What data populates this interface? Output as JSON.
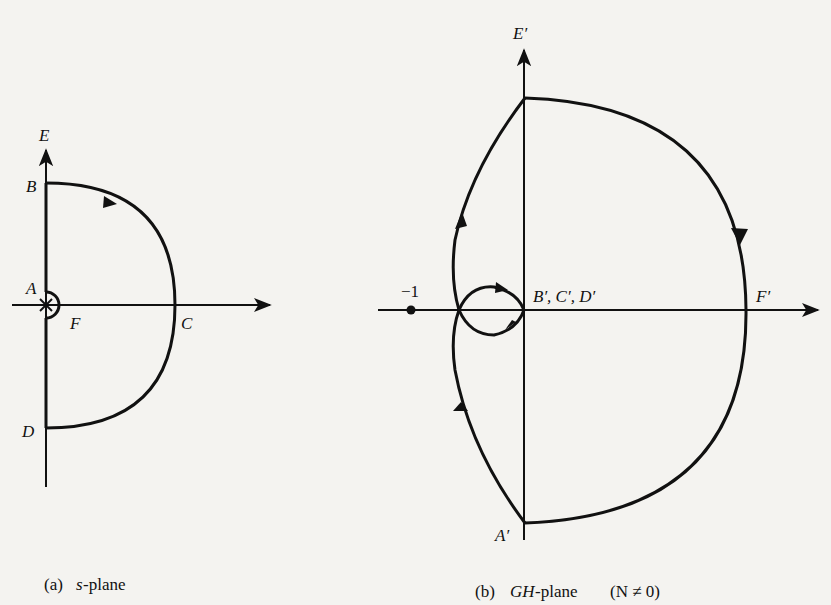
{
  "panel_a": {
    "labels": {
      "E": "E",
      "B": "B",
      "A": "A",
      "F": "F",
      "C": "C",
      "D": "D"
    },
    "caption": {
      "tag": "(a)",
      "var": "s",
      "text": "-plane"
    }
  },
  "panel_b": {
    "labels": {
      "E": "E′",
      "BCD": "B′, C′, D′",
      "F": "F′",
      "A": "A′",
      "minus_one": "−1"
    },
    "caption": {
      "tag": "(b)",
      "var": "GH",
      "text": "-plane",
      "cond": "(N ≠ 0)"
    }
  },
  "colors": {
    "ink": "#111111",
    "background": "#f4f3f0"
  }
}
